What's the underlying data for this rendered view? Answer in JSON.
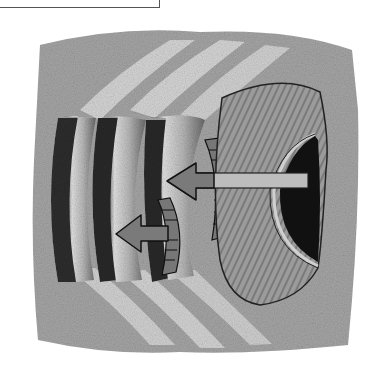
{
  "figure": {
    "label_box": {
      "text": ""
    },
    "elements": {
      "shell": "scallop-shell",
      "ripples": [
        "ripple-1",
        "ripple-2",
        "ripple-3"
      ],
      "arrows": [
        {
          "name": "upper-arrow",
          "direction": "left"
        },
        {
          "name": "lower-arrow",
          "direction": "left"
        }
      ]
    },
    "colors": {
      "sand": "#9a9a9a",
      "sand_light": "#d8d8d8",
      "shadow": "#2a2a2a",
      "shell": "#8c8c8c",
      "arrow_fill": "#7a7a7a",
      "arrow_shaft": "#bdbdbd",
      "outline": "#1a1a1a"
    }
  }
}
